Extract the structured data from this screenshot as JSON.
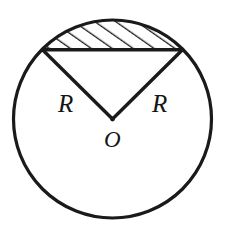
{
  "figure": {
    "kind": "geometry-diagram",
    "background_color": "#ffffff",
    "stroke_color": "#1a1a1a",
    "hatch_color": "#1a1a1a"
  },
  "canvas": {
    "width": 229,
    "height": 236
  },
  "circle": {
    "center_x": 112.5,
    "center_y": 119,
    "radius": 99,
    "stroke_width": 3.2
  },
  "chord": {
    "x1": 42.5,
    "y1": 49.8,
    "x2": 182.5,
    "y2": 49.8,
    "stroke_width": 3.4
  },
  "radii": [
    {
      "label": "R",
      "from_x": 112.5,
      "from_y": 119,
      "to_x": 42.5,
      "to_y": 49.8,
      "stroke_width": 3.4
    },
    {
      "label": "R",
      "from_x": 112.5,
      "from_y": 119,
      "to_x": 182.5,
      "to_y": 49.8,
      "stroke_width": 3.4
    }
  ],
  "segment": {
    "hatched": true,
    "hatch_angle_deg": 55,
    "hatch_spacing": 12,
    "hatch_stroke_width": 2.6,
    "hatch_line_count": 12
  },
  "labels": {
    "radius_left": {
      "text": "R",
      "x": 58,
      "y": 112
    },
    "radius_right": {
      "text": "R",
      "x": 152,
      "y": 112
    },
    "center": {
      "text": "O",
      "x": 104,
      "y": 147
    }
  }
}
